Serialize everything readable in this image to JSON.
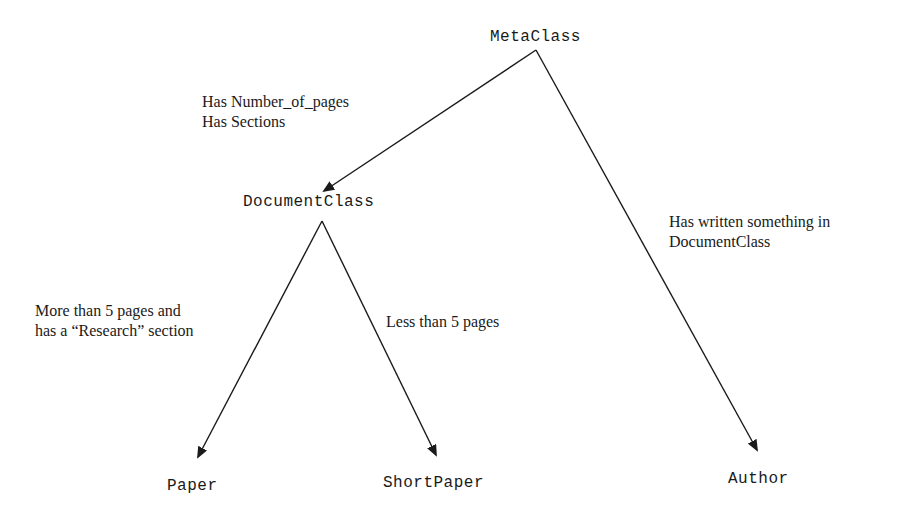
{
  "diagram": {
    "type": "class-hierarchy",
    "nodes": {
      "metaclass": "MetaClass",
      "documentclass": "DocumentClass",
      "paper": "Paper",
      "shortpaper": "ShortPaper",
      "author": "Author"
    },
    "edges": [
      {
        "from": "MetaClass",
        "to": "DocumentClass",
        "label": [
          "Has Number_of_pages",
          "Has Sections"
        ]
      },
      {
        "from": "MetaClass",
        "to": "Author",
        "label": [
          "Has written something in",
          "DocumentClass"
        ]
      },
      {
        "from": "DocumentClass",
        "to": "Paper",
        "label": [
          "More than 5 pages and",
          "has a “Research” section"
        ]
      },
      {
        "from": "DocumentClass",
        "to": "ShortPaper",
        "label": [
          "Less than 5 pages"
        ]
      }
    ],
    "colors": {
      "line": "#1a1a1a",
      "background": "#ffffff"
    }
  }
}
